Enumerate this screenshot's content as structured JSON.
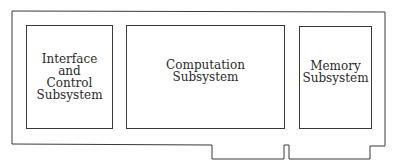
{
  "diagram": {
    "board_label": "circuit-board",
    "subsystems": [
      {
        "id": "interface",
        "label": "Interface\nand\nControl\nSubsystem"
      },
      {
        "id": "computation",
        "label": "Computation\nSubsystem"
      },
      {
        "id": "memory",
        "label": "Memory\nSubsystem"
      }
    ],
    "colors": {
      "line": "#3a3a3a",
      "text": "#2a2a2a",
      "background": "#ffffff"
    }
  }
}
